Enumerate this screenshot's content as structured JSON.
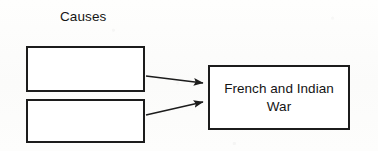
{
  "diagram": {
    "type": "cause-and-effect-flow",
    "title_label": "Causes",
    "background_color": "#fdfdfc",
    "line_color": "#1c1c1c",
    "text_color": "#141414",
    "cause_boxes": [
      {
        "id": "cause-1",
        "label": "",
        "x": 26,
        "y": 46,
        "width": 119,
        "height": 46
      },
      {
        "id": "cause-2",
        "label": "",
        "x": 26,
        "y": 99,
        "width": 119,
        "height": 44
      }
    ],
    "effect_box": {
      "id": "effect-1",
      "line1": "French and Indian",
      "line2": "War",
      "x": 208,
      "y": 65,
      "width": 142,
      "height": 65
    },
    "arrows": [
      {
        "id": "arrow-1",
        "from": "cause-1",
        "to": "effect-1",
        "x1": 146,
        "y1": 76,
        "x2": 205,
        "y2": 83
      },
      {
        "id": "arrow-2",
        "from": "cause-2",
        "to": "effect-1",
        "x1": 146,
        "y1": 115,
        "x2": 205,
        "y2": 102
      }
    ]
  }
}
